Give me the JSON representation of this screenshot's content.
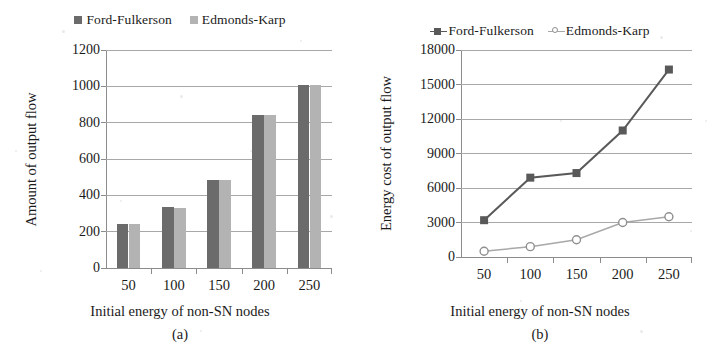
{
  "figure": {
    "background": "#ffffff",
    "series_colors": {
      "ford_fulkerson": "#6b6b6b",
      "edmonds_karp": "#b3b3b3",
      "ford_fulkerson_line": "#595959",
      "edmonds_karp_line": "#a8a8a8",
      "axis": "#8c8c8c",
      "grid": "#a8a8a8",
      "text": "#1a1a1a"
    }
  },
  "panel_a": {
    "caption": "(a)",
    "legend": [
      {
        "label": "Ford-Fulkerson",
        "marker": "square-filled-dark",
        "color": "#6b6b6b"
      },
      {
        "label": "Edmonds-Karp",
        "marker": "square-filled-light",
        "color": "#b3b3b3"
      }
    ],
    "chart_data": {
      "type": "bar",
      "title": "",
      "xlabel": "Initial energy of non-SN nodes",
      "ylabel": "Amount of output flow",
      "categories": [
        "50",
        "100",
        "150",
        "200",
        "250"
      ],
      "series": [
        {
          "name": "Ford-Fulkerson",
          "values": [
            240,
            335,
            485,
            845,
            1005
          ],
          "color": "#6b6b6b"
        },
        {
          "name": "Edmonds-Karp",
          "values": [
            240,
            332,
            483,
            845,
            1005
          ],
          "color": "#b3b3b3"
        }
      ],
      "ylim": [
        0,
        1200
      ],
      "yticks": [
        0,
        200,
        400,
        600,
        800,
        1000,
        1200
      ],
      "ytick_labels": [
        "0",
        "200",
        "400",
        "600",
        "800",
        "1000",
        "1200"
      ],
      "grid": true,
      "legend_position": "top-center"
    }
  },
  "panel_b": {
    "caption": "(b)",
    "legend": [
      {
        "label": "Ford-Fulkerson",
        "marker": "line-square-filled",
        "color": "#595959"
      },
      {
        "label": "Edmonds-Karp",
        "marker": "line-circle-open",
        "color": "#a8a8a8"
      }
    ],
    "chart_data": {
      "type": "line",
      "title": "",
      "xlabel": "Initial energy of non-SN nodes",
      "ylabel": "Energy cost of output flow",
      "x": [
        50,
        100,
        150,
        200,
        250
      ],
      "xtick_labels": [
        "50",
        "100",
        "150",
        "200",
        "250"
      ],
      "series": [
        {
          "name": "Ford-Fulkerson",
          "values": [
            3200,
            6900,
            7300,
            11000,
            16300
          ],
          "color": "#595959",
          "marker": "square-filled"
        },
        {
          "name": "Edmonds-Karp",
          "values": [
            500,
            900,
            1500,
            3000,
            3500
          ],
          "color": "#a8a8a8",
          "marker": "circle-open"
        }
      ],
      "ylim": [
        0,
        18000
      ],
      "yticks": [
        0,
        3000,
        6000,
        9000,
        12000,
        15000,
        18000
      ],
      "ytick_labels": [
        "0",
        "3000",
        "6000",
        "9000",
        "12000",
        "15000",
        "18000"
      ],
      "grid": true,
      "legend_position": "top-center"
    }
  }
}
